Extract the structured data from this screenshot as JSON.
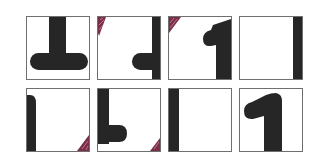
{
  "puzzle": {
    "rows": 2,
    "cols": 4,
    "colors": {
      "ink": "#262626",
      "border": "#6f6f6f",
      "marker": "#7a2e47",
      "background": "#ffffff"
    },
    "tiles": [
      {
        "row": 0,
        "col": 0,
        "shape": "inverted-t",
        "marker": "none"
      },
      {
        "row": 0,
        "col": 1,
        "shape": "right-bar-with-left-foot",
        "marker": "top-left"
      },
      {
        "row": 0,
        "col": 2,
        "shape": "one-top",
        "marker": "top-left"
      },
      {
        "row": 0,
        "col": 3,
        "shape": "right-bar",
        "marker": "none"
      },
      {
        "row": 1,
        "col": 0,
        "shape": "left-bar-rounded-top",
        "marker": "bottom-right"
      },
      {
        "row": 1,
        "col": 1,
        "shape": "l-shape",
        "marker": "bottom-right"
      },
      {
        "row": 1,
        "col": 2,
        "shape": "left-bar",
        "marker": "none"
      },
      {
        "row": 1,
        "col": 3,
        "shape": "digit-one",
        "marker": "none"
      }
    ]
  }
}
